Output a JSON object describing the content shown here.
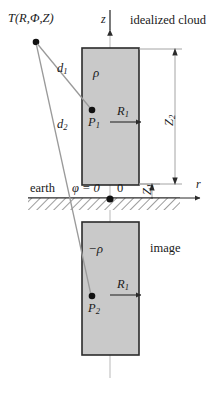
{
  "figure": {
    "title_region": "idealized cloud dipole diagram",
    "background_color": "#ffffff",
    "line_color": "#6e6e6e",
    "dark_line_color": "#2b2b2b",
    "cloud_fill": "#c9c9c9",
    "text_color": "#1a1a1a"
  },
  "labels": {
    "observation_point": "T(R,Φ,Z)",
    "z_axis": "z",
    "r_axis": "r",
    "idealized_cloud": "idealized cloud",
    "image": "image",
    "earth": "earth",
    "phi_zero": "φ = 0",
    "origin": "0",
    "charge_upper": "ρ",
    "charge_lower": "−ρ",
    "point_upper": "P",
    "point_upper_sub": "1",
    "point_lower": "P",
    "point_lower_sub": "2",
    "radius_upper": "R",
    "radius_upper_sub": "1",
    "radius_lower": "R",
    "radius_lower_sub": "1",
    "distance_1": "d",
    "distance_1_sub": "1",
    "distance_2": "d",
    "distance_2_sub": "2",
    "height_upper": "Z",
    "height_upper_sub": "2",
    "height_lower": "Z",
    "height_lower_sub": "1"
  },
  "geometry": {
    "z_axis_x": 110,
    "z_axis_top": 10,
    "r_axis_y": 198,
    "r_axis_right": 206,
    "cloud_left": 82,
    "cloud_right": 139,
    "cloud_top": 48,
    "cloud_bottom": 185,
    "image_top": 222,
    "image_bottom": 355,
    "earth_band_top": 198,
    "earth_band_bottom": 210,
    "earth_band_left": 28,
    "earth_band_right": 180,
    "observer_x": 36,
    "observer_y": 42,
    "p1_x": 92,
    "p1_y": 110,
    "p2_x": 92,
    "p2_y": 296,
    "dim_z2_x": 175,
    "dim_z1_x": 152
  }
}
